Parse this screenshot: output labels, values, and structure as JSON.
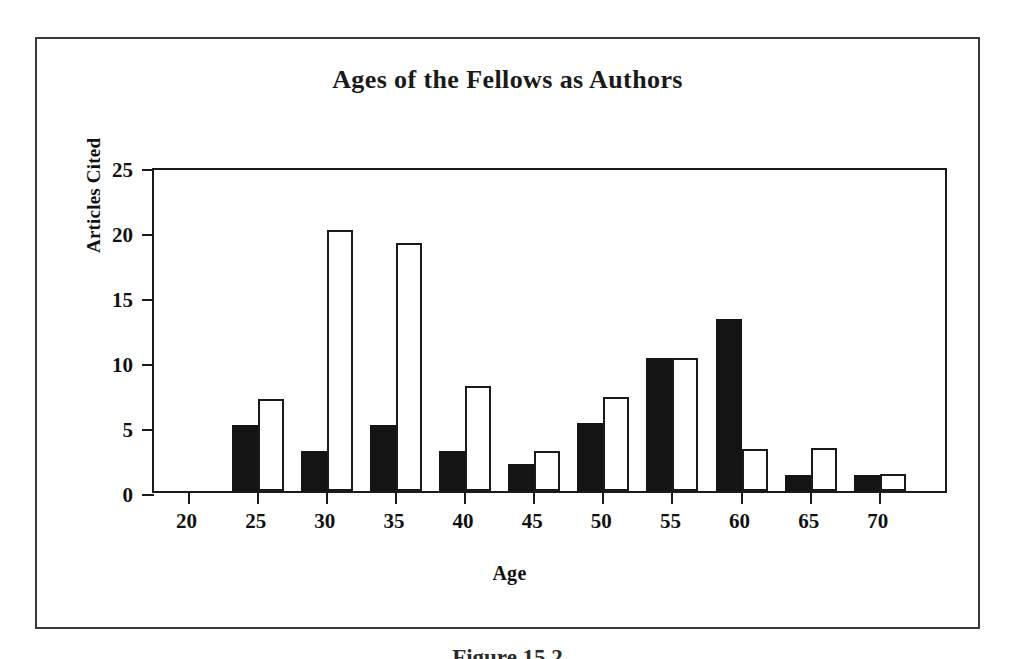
{
  "figure": {
    "caption": "Figure 15.2"
  },
  "chart_data": {
    "type": "bar",
    "title": "Ages of  the Fellows as Authors",
    "xlabel": "Age",
    "ylabel": "Articles Cited",
    "categories": [
      "20",
      "25",
      "30",
      "35",
      "40",
      "45",
      "50",
      "55",
      "60",
      "65",
      "70"
    ],
    "xlim": [
      17.5,
      75
    ],
    "ylim": [
      0,
      25
    ],
    "yticks": [
      0,
      5,
      10,
      15,
      20,
      25
    ],
    "ytick_labels": [
      "0",
      "5",
      "10",
      "15",
      "20",
      "25"
    ],
    "grid": false,
    "legend": "none",
    "series": [
      {
        "name": "filled",
        "style": "solid-black",
        "color": "#141414",
        "values": [
          0,
          5.1,
          3.1,
          5.1,
          3.1,
          2.1,
          5.2,
          10.2,
          13.2,
          1.2,
          1.2
        ]
      },
      {
        "name": "hollow",
        "style": "white-outline",
        "color": "#ffffff",
        "edge_color": "#1a1a1a",
        "values": [
          0,
          7.1,
          20.1,
          19.1,
          8.1,
          3.1,
          7.2,
          10.2,
          3.2,
          3.3,
          1.3
        ]
      }
    ]
  }
}
